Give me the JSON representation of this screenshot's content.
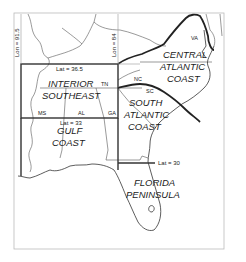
{
  "map": {
    "regions": [
      {
        "id": "central-atlantic-coast",
        "lines": [
          "CENTRAL",
          "ATLANTIC",
          "COAST"
        ]
      },
      {
        "id": "interior-southeast",
        "lines": [
          "INTERIOR",
          "SOUTHEAST"
        ]
      },
      {
        "id": "south-atlantic-coast",
        "lines": [
          "SOUTH",
          "ATLANTIC",
          "COAST"
        ]
      },
      {
        "id": "gulf-coast",
        "lines": [
          "GULF",
          "COAST"
        ]
      },
      {
        "id": "florida-peninsula",
        "lines": [
          "FLORIDA",
          "PENINSULA"
        ]
      }
    ],
    "states": {
      "va": "VA",
      "tn": "TN",
      "nc": "NC",
      "sc": "SC",
      "ms": "MS",
      "al": "AL",
      "ga": "GA"
    },
    "coordinate_labels": {
      "lon_915": "Lon = 91.5",
      "lon_84": "Lon = 84",
      "lat_365": "Lat = 36.5",
      "lat_33": "Lat = 33",
      "lat_30": "Lat = 30"
    }
  }
}
